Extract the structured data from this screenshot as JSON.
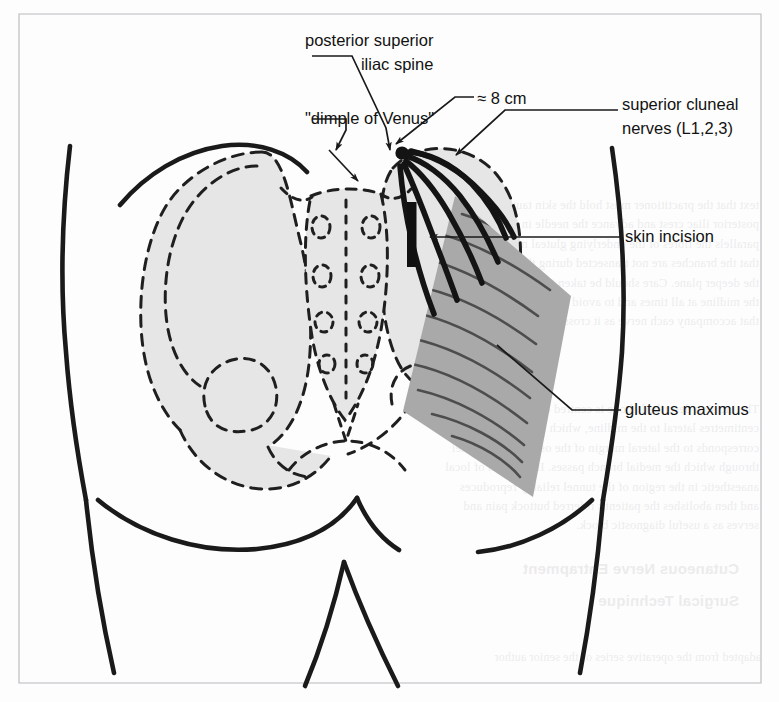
{
  "figure": {
    "kind": "anatomical-line-diagram",
    "frame_color": "#b9b9bd",
    "background_color": "#fdfdfd",
    "ink_color": "#1a1a1a",
    "bone_fill_color": "#e6e6e6",
    "muscle_fill_color": "#a9a9a9",
    "nerve_color": "#141414",
    "incision_color": "#111111"
  },
  "labels": {
    "psis": {
      "id": "posterior-superior-iliac-spine",
      "line1": "posterior superior",
      "line2": "iliac spine",
      "anchor": "left",
      "x": 305,
      "y": 46
    },
    "dimple": {
      "id": "dimple-of-venus",
      "line1": "\"dimple of Venus\"",
      "anchor": "left",
      "x": 305,
      "y": 124
    },
    "measurement": {
      "id": "eight-centimeters",
      "line1": "≈ 8 cm",
      "anchor": "left",
      "x": 477,
      "y": 104
    },
    "cluneal": {
      "id": "superior-cluneal-nerves",
      "line1": "superior cluneal",
      "line2": "nerves (L1,2,3)",
      "anchor": "left",
      "x": 622,
      "y": 110
    },
    "incision": {
      "id": "skin-incision",
      "line1": "skin incision",
      "anchor": "left",
      "x": 625,
      "y": 242
    },
    "gluteus": {
      "id": "gluteus-maximus",
      "line1": "gluteus maximus",
      "anchor": "left",
      "x": 625,
      "y": 415
    }
  },
  "structures": [
    {
      "name": "body-outline",
      "type": "solid-contour"
    },
    {
      "name": "iliac-crest-left",
      "type": "solid-contour"
    },
    {
      "name": "ilium-left",
      "type": "dashed-bone",
      "fill": "#e6e6e6"
    },
    {
      "name": "ilium-right",
      "type": "dashed-bone",
      "fill": "#e6e6e6"
    },
    {
      "name": "sacrum",
      "type": "dashed-bone",
      "fill": "#e6e6e6"
    },
    {
      "name": "sacral-foramina",
      "type": "dashed-ovals",
      "count": 8
    },
    {
      "name": "coccyx",
      "type": "dashed-bone"
    },
    {
      "name": "obturator-foramen-left",
      "type": "dashed-outline"
    },
    {
      "name": "obturator-foramen-right",
      "type": "dashed-outline"
    },
    {
      "name": "gluteus-maximus-muscle",
      "type": "filled-polygon",
      "fill": "#a9a9a9"
    },
    {
      "name": "muscle-fiber-striations",
      "type": "stroke-group",
      "count": 11
    },
    {
      "name": "superior-cluneal-nerves",
      "type": "thick-curves",
      "count": 6
    },
    {
      "name": "skin-incision-bar",
      "type": "thick-bar"
    },
    {
      "name": "gluteal-fold",
      "type": "solid-contour"
    }
  ],
  "bleed_through": {
    "note": "faint mirrored text showing through from the reverse page",
    "blocks": [
      "text that the practitioner must hold the skin taut over the\nposterior iliac crest and advance the needle in a plane that\nparallels the fibres of the underlying gluteal musculature so\nthat the branches are not transected during the approach to\nthe deeper plane. Care should be taken to remain lateral to\nthe midline at all times and to avoid the perforating vessels\nthat accompany each nerve as it crosses the crest.",
      "The incision described above is centred on a point eight\ncentimetres lateral to the midline, which in most adults\ncorresponds to the lateral margin of the osteofibrous tunnel\nthrough which the medial branch passes. Infiltration of local\nanaesthetic in the region of the tunnel reliably reproduces\nand then abolishes the patient's referred buttock pain and\nserves as a useful diagnostic block."
    ],
    "headings": [
      "Cutaneous Nerve Entrapment",
      "Surgical Technique"
    ],
    "footer": "adapted from the operative series of the senior author"
  }
}
